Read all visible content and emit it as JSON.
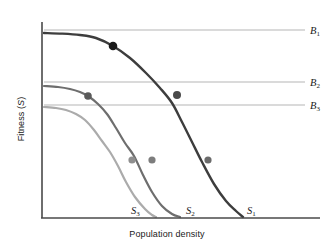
{
  "chart_data": {
    "type": "line",
    "title": "",
    "xlabel": "Population density",
    "ylabel": "Fitness (S)",
    "grid": false,
    "axes": {
      "x_range_px": [
        42,
        320
      ],
      "y_range_px": [
        218,
        22
      ],
      "ticks_shown": false,
      "tick_labels_x": [],
      "tick_labels_y": []
    },
    "legend": {
      "position": "inline-end-of-curve",
      "entries": [
        "S1",
        "S2",
        "S3"
      ]
    },
    "series": [
      {
        "name": "S1",
        "label": "S",
        "subscript": "1",
        "color": "#3d3d3d",
        "linewidth": 2.4,
        "description": "Highest fitness sigmoid decline curve",
        "label_pos_px": [
          247,
          205
        ],
        "points_px": [
          [
            44,
            33
          ],
          [
            62,
            33.6
          ],
          [
            80,
            35
          ],
          [
            96,
            38
          ],
          [
            113,
            46
          ],
          [
            130,
            58
          ],
          [
            146,
            73
          ],
          [
            160,
            88
          ],
          [
            172,
            103
          ],
          [
            182,
            122
          ],
          [
            192,
            142
          ],
          [
            202,
            162
          ],
          [
            214,
            184
          ],
          [
            226,
            201
          ],
          [
            236,
            211
          ],
          [
            243,
            217
          ]
        ]
      },
      {
        "name": "S2",
        "label": "S",
        "subscript": "2",
        "color": "#6e6e6e",
        "linewidth": 2.2,
        "description": "Intermediate fitness sigmoid decline curve",
        "label_pos_px": [
          186,
          205
        ],
        "points_px": [
          [
            44,
            86
          ],
          [
            58,
            87
          ],
          [
            70,
            89
          ],
          [
            80,
            92
          ],
          [
            88,
            96
          ],
          [
            98,
            104
          ],
          [
            107,
            114
          ],
          [
            116,
            128
          ],
          [
            125,
            143
          ],
          [
            134,
            156
          ],
          [
            143,
            175
          ],
          [
            152,
            192
          ],
          [
            162,
            206
          ],
          [
            172,
            214
          ],
          [
            180,
            217
          ]
        ]
      },
      {
        "name": "S3",
        "label": "S",
        "subscript": "3",
        "color": "#ababab",
        "linewidth": 2.2,
        "description": "Lowest fitness sigmoid decline curve",
        "label_pos_px": [
          131,
          205
        ],
        "points_px": [
          [
            44,
            107
          ],
          [
            56,
            108
          ],
          [
            66,
            110
          ],
          [
            76,
            114
          ],
          [
            85,
            120
          ],
          [
            94,
            130
          ],
          [
            102,
            141
          ],
          [
            110,
            152
          ],
          [
            118,
            166
          ],
          [
            126,
            182
          ],
          [
            135,
            197
          ],
          [
            145,
            209
          ],
          [
            152,
            215
          ],
          [
            156,
            217
          ]
        ]
      }
    ],
    "threshold_lines": [
      {
        "name": "B1",
        "label": "B",
        "subscript": "1",
        "y_px": 30,
        "x_start_px": 44,
        "x_end_px": 305,
        "color": "#b5b5b5",
        "label_pos_px": [
          310,
          25
        ]
      },
      {
        "name": "B2",
        "label": "B",
        "subscript": "2",
        "y_px": 82,
        "x_start_px": 44,
        "x_end_px": 305,
        "color": "#b5b5b5",
        "label_pos_px": [
          310,
          77
        ]
      },
      {
        "name": "B3",
        "label": "B",
        "subscript": "3",
        "y_px": 105,
        "x_start_px": 44,
        "x_end_px": 305,
        "color": "#b5b5b5",
        "label_pos_px": [
          310,
          100
        ]
      }
    ],
    "markers": [
      {
        "id": "m-s1-upper",
        "series": "S1",
        "cx": 113,
        "cy": 46,
        "r": 4.3,
        "color": "#1a1a1a"
      },
      {
        "id": "m-s2-upper",
        "series": "S2",
        "cx": 88,
        "cy": 96,
        "r": 3.8,
        "color": "#5a5a5a"
      },
      {
        "id": "m-s1-mid",
        "series": "S1",
        "cx": 177,
        "cy": 95,
        "r": 4.0,
        "color": "#4a4a4a"
      },
      {
        "id": "m-s3-lower",
        "series": "S3",
        "cx": 132,
        "cy": 160,
        "r": 3.6,
        "color": "#8f8f8f"
      },
      {
        "id": "m-s2-lower",
        "series": "S2",
        "cx": 152,
        "cy": 160,
        "r": 3.6,
        "color": "#7d7d7d"
      },
      {
        "id": "m-s1-lower",
        "series": "S1",
        "cx": 208,
        "cy": 160,
        "r": 3.6,
        "color": "#6b6b6b"
      }
    ]
  },
  "labels": {
    "xlabel": "Population density",
    "ylabel_prefix": "Fitness (",
    "ylabel_symbol": "S",
    "ylabel_suffix": ")",
    "b1": "B",
    "b1_sub": "1",
    "b2": "B",
    "b2_sub": "2",
    "b3": "B",
    "b3_sub": "3",
    "s1": "S",
    "s1_sub": "1",
    "s2": "S",
    "s2_sub": "2",
    "s3": "S",
    "s3_sub": "3"
  },
  "colors": {
    "axis": "#4a4a4a",
    "background": "#ffffff",
    "threshold_line": "#b5b5b5",
    "s1": "#3d3d3d",
    "s2": "#6e6e6e",
    "s3": "#ababab"
  }
}
